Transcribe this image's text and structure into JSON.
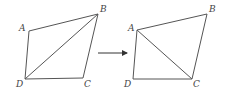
{
  "diagram": {
    "colors": {
      "line": "#555555",
      "label": "#444444",
      "background": "#ffffff"
    },
    "left_figure": {
      "vertices": {
        "A": {
          "label": "A",
          "x": 29,
          "y": 31,
          "lx": 19,
          "ly": 31
        },
        "B": {
          "label": "B",
          "x": 98,
          "y": 14,
          "lx": 100,
          "ly": 12
        },
        "C": {
          "label": "C",
          "x": 83,
          "y": 78,
          "lx": 84,
          "ly": 87
        },
        "D": {
          "label": "D",
          "x": 25,
          "y": 79,
          "lx": 16,
          "ly": 87
        }
      },
      "diagonal": "DB"
    },
    "arrow": {
      "x1": 98,
      "y1": 53,
      "x2": 127,
      "y2": 53,
      "label": "→"
    },
    "right_figure": {
      "vertices": {
        "A": {
          "label": "A",
          "x": 137,
          "y": 30,
          "lx": 128,
          "ly": 31
        },
        "B": {
          "label": "B",
          "x": 207,
          "y": 14,
          "lx": 209,
          "ly": 12
        },
        "C": {
          "label": "C",
          "x": 192,
          "y": 79,
          "lx": 193,
          "ly": 87
        },
        "D": {
          "label": "D",
          "x": 133,
          "y": 79,
          "lx": 124,
          "ly": 87
        }
      },
      "diagonal": "AC"
    }
  }
}
